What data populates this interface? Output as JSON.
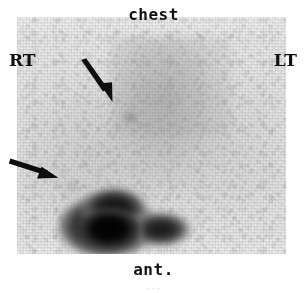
{
  "image": {
    "modality": "nuclear-medicine-scintigram",
    "view": "anterior",
    "body_region": "chest",
    "width_px": 307,
    "height_px": 293,
    "background_color": "#ffffff",
    "field_color": "#ebebeb",
    "uptake_color": "#000000",
    "annotation_color": "#111111"
  },
  "labels": {
    "top": "chest",
    "left": "RT",
    "right": "LT",
    "bottom": "ant.",
    "footer_artifact": "..."
  },
  "annotations": {
    "arrows": [
      {
        "name": "upper-arrow",
        "direction": "down-right",
        "angle_deg": 55,
        "points_to": "focal uptake in right upper chest",
        "tip_x": 112,
        "tip_y": 97
      },
      {
        "name": "lateral-arrow",
        "direction": "right",
        "angle_deg": 8,
        "points_to": "focal uptake at right lateral chest wall",
        "tip_x": 56,
        "tip_y": 176
      }
    ]
  },
  "regions": [
    {
      "name": "scan-field",
      "x": 17,
      "y": 17,
      "width": 269,
      "height": 237,
      "description": "grainy gamma-camera detector field"
    },
    {
      "name": "mediastinum",
      "description": "diffuse moderate uptake band, upper central chest"
    },
    {
      "name": "liver",
      "description": "intense focal uptake, lower left of image (patient right upper quadrant)"
    },
    {
      "name": "focal-lesion-upper",
      "description": "small focal uptake indicated by upper arrow"
    },
    {
      "name": "focal-lesion-lateral",
      "description": "faint focal uptake indicated by lateral arrow"
    }
  ]
}
